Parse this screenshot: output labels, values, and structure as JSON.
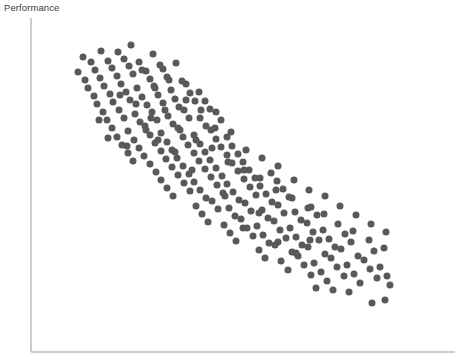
{
  "figure": {
    "width": 455,
    "height": 363,
    "background": "#ffffff"
  },
  "labels": {
    "ylabel": "Performance",
    "xlabel": ""
  },
  "axes": {
    "line_color": "#9a9a9a",
    "line_width": 1,
    "x_axis": {
      "x1": 31,
      "y1": 352,
      "x2": 455,
      "y2": 352
    },
    "y_axis": {
      "x1": 31,
      "y1": 18,
      "x2": 31,
      "y2": 352
    },
    "ticks": "none",
    "tick_labels": "none",
    "grid": false
  },
  "chart_data": {
    "type": "scatter",
    "title": "",
    "xlabel": "",
    "ylabel": "Performance",
    "grid": false,
    "legend": "none",
    "marker": {
      "shape": "circle",
      "color": "#595959",
      "diameter_px": 7,
      "opacity": 1
    },
    "xlim": [
      31,
      455
    ],
    "ylim": [
      18,
      352
    ],
    "y_axis_direction": "inverted-pixel",
    "correlation": "strong negative",
    "n_points": 248,
    "points": [
      [
        83,
        57
      ],
      [
        101,
        51
      ],
      [
        118,
        52
      ],
      [
        131,
        45
      ],
      [
        153,
        54
      ],
      [
        91,
        62
      ],
      [
        108,
        61
      ],
      [
        124,
        59
      ],
      [
        139,
        62
      ],
      [
        160,
        65
      ],
      [
        78,
        72
      ],
      [
        95,
        70
      ],
      [
        112,
        68
      ],
      [
        129,
        66
      ],
      [
        146,
        71
      ],
      [
        163,
        69
      ],
      [
        176,
        63
      ],
      [
        85,
        80
      ],
      [
        100,
        78
      ],
      [
        117,
        76
      ],
      [
        133,
        74
      ],
      [
        150,
        79
      ],
      [
        167,
        77
      ],
      [
        182,
        81
      ],
      [
        88,
        88
      ],
      [
        104,
        86
      ],
      [
        121,
        84
      ],
      [
        137,
        88
      ],
      [
        154,
        86
      ],
      [
        171,
        90
      ],
      [
        186,
        84
      ],
      [
        199,
        92
      ],
      [
        94,
        96
      ],
      [
        110,
        94
      ],
      [
        126,
        92
      ],
      [
        142,
        97
      ],
      [
        158,
        95
      ],
      [
        175,
        99
      ],
      [
        190,
        93
      ],
      [
        205,
        101
      ],
      [
        97,
        104
      ],
      [
        113,
        102
      ],
      [
        130,
        100
      ],
      [
        147,
        105
      ],
      [
        163,
        103
      ],
      [
        179,
        107
      ],
      [
        195,
        101
      ],
      [
        210,
        109
      ],
      [
        103,
        112
      ],
      [
        119,
        110
      ],
      [
        135,
        114
      ],
      [
        152,
        112
      ],
      [
        168,
        116
      ],
      [
        184,
        110
      ],
      [
        200,
        118
      ],
      [
        216,
        112
      ],
      [
        107,
        120
      ],
      [
        124,
        118
      ],
      [
        140,
        122
      ],
      [
        157,
        120
      ],
      [
        173,
        124
      ],
      [
        189,
        118
      ],
      [
        206,
        126
      ],
      [
        221,
        120
      ],
      [
        112,
        128
      ],
      [
        128,
        131
      ],
      [
        145,
        126
      ],
      [
        161,
        133
      ],
      [
        178,
        128
      ],
      [
        194,
        135
      ],
      [
        211,
        130
      ],
      [
        227,
        137
      ],
      [
        117,
        137
      ],
      [
        134,
        140
      ],
      [
        150,
        135
      ],
      [
        167,
        142
      ],
      [
        183,
        137
      ],
      [
        200,
        144
      ],
      [
        216,
        139
      ],
      [
        232,
        146
      ],
      [
        122,
        145
      ],
      [
        139,
        148
      ],
      [
        155,
        143
      ],
      [
        172,
        150
      ],
      [
        188,
        145
      ],
      [
        205,
        152
      ],
      [
        221,
        147
      ],
      [
        238,
        154
      ],
      [
        128,
        153
      ],
      [
        144,
        156
      ],
      [
        161,
        151
      ],
      [
        177,
        158
      ],
      [
        194,
        153
      ],
      [
        210,
        160
      ],
      [
        227,
        155
      ],
      [
        243,
        162
      ],
      [
        133,
        161
      ],
      [
        150,
        164
      ],
      [
        166,
        159
      ],
      [
        183,
        166
      ],
      [
        199,
        161
      ],
      [
        216,
        168
      ],
      [
        232,
        163
      ],
      [
        249,
        170
      ],
      [
        156,
        172
      ],
      [
        172,
        167
      ],
      [
        189,
        174
      ],
      [
        205,
        169
      ],
      [
        222,
        176
      ],
      [
        238,
        171
      ],
      [
        255,
        178
      ],
      [
        271,
        173
      ],
      [
        161,
        180
      ],
      [
        178,
        175
      ],
      [
        194,
        182
      ],
      [
        211,
        177
      ],
      [
        227,
        184
      ],
      [
        244,
        179
      ],
      [
        260,
        186
      ],
      [
        277,
        181
      ],
      [
        167,
        188
      ],
      [
        184,
        183
      ],
      [
        200,
        190
      ],
      [
        217,
        185
      ],
      [
        233,
        192
      ],
      [
        250,
        187
      ],
      [
        266,
        194
      ],
      [
        283,
        189
      ],
      [
        173,
        196
      ],
      [
        190,
        191
      ],
      [
        206,
        198
      ],
      [
        223,
        193
      ],
      [
        239,
        200
      ],
      [
        256,
        195
      ],
      [
        272,
        202
      ],
      [
        289,
        197
      ],
      [
        196,
        206
      ],
      [
        212,
        201
      ],
      [
        229,
        208
      ],
      [
        245,
        203
      ],
      [
        262,
        210
      ],
      [
        278,
        205
      ],
      [
        295,
        212
      ],
      [
        311,
        207
      ],
      [
        202,
        214
      ],
      [
        218,
        209
      ],
      [
        235,
        216
      ],
      [
        251,
        211
      ],
      [
        268,
        218
      ],
      [
        284,
        213
      ],
      [
        301,
        220
      ],
      [
        317,
        215
      ],
      [
        208,
        222
      ],
      [
        224,
        225
      ],
      [
        241,
        219
      ],
      [
        257,
        226
      ],
      [
        274,
        221
      ],
      [
        290,
        228
      ],
      [
        307,
        223
      ],
      [
        323,
        230
      ],
      [
        230,
        233
      ],
      [
        247,
        228
      ],
      [
        263,
        235
      ],
      [
        280,
        230
      ],
      [
        296,
        237
      ],
      [
        313,
        232
      ],
      [
        329,
        239
      ],
      [
        345,
        234
      ],
      [
        236,
        241
      ],
      [
        253,
        236
      ],
      [
        269,
        243
      ],
      [
        286,
        238
      ],
      [
        302,
        245
      ],
      [
        319,
        240
      ],
      [
        335,
        247
      ],
      [
        351,
        242
      ],
      [
        259,
        250
      ],
      [
        275,
        245
      ],
      [
        292,
        252
      ],
      [
        308,
        247
      ],
      [
        325,
        254
      ],
      [
        341,
        249
      ],
      [
        358,
        256
      ],
      [
        374,
        251
      ],
      [
        265,
        258
      ],
      [
        281,
        261
      ],
      [
        298,
        256
      ],
      [
        314,
        263
      ],
      [
        331,
        258
      ],
      [
        347,
        265
      ],
      [
        364,
        260
      ],
      [
        380,
        267
      ],
      [
        288,
        270
      ],
      [
        304,
        265
      ],
      [
        321,
        272
      ],
      [
        337,
        267
      ],
      [
        354,
        274
      ],
      [
        370,
        269
      ],
      [
        387,
        276
      ],
      [
        311,
        275
      ],
      [
        327,
        281
      ],
      [
        344,
        276
      ],
      [
        360,
        283
      ],
      [
        377,
        278
      ],
      [
        390,
        285
      ],
      [
        372,
        303
      ],
      [
        385,
        300
      ],
      [
        316,
        288
      ],
      [
        333,
        290
      ],
      [
        349,
        292
      ],
      [
        142,
        70
      ],
      [
        155,
        88
      ],
      [
        169,
        80
      ],
      [
        186,
        100
      ],
      [
        201,
        110
      ],
      [
        215,
        128
      ],
      [
        231,
        132
      ],
      [
        246,
        150
      ],
      [
        262,
        158
      ],
      [
        278,
        166
      ],
      [
        294,
        180
      ],
      [
        309,
        190
      ],
      [
        325,
        196
      ],
      [
        340,
        206
      ],
      [
        356,
        215
      ],
      [
        371,
        224
      ],
      [
        386,
        232
      ],
      [
        120,
        95
      ],
      [
        136,
        104
      ],
      [
        151,
        118
      ],
      [
        165,
        110
      ],
      [
        180,
        130
      ],
      [
        196,
        140
      ],
      [
        212,
        148
      ],
      [
        228,
        162
      ],
      [
        244,
        170
      ],
      [
        260,
        178
      ],
      [
        276,
        190
      ],
      [
        292,
        198
      ],
      [
        308,
        208
      ],
      [
        324,
        214
      ],
      [
        338,
        224
      ],
      [
        353,
        231
      ],
      [
        369,
        240
      ],
      [
        384,
        248
      ],
      [
        99,
        120
      ],
      [
        108,
        138
      ],
      [
        127,
        146
      ],
      [
        146,
        130
      ],
      [
        243,
        228
      ],
      [
        278,
        242
      ],
      [
        296,
        253
      ],
      [
        310,
        240
      ],
      [
        259,
        213
      ],
      [
        225,
        196
      ],
      [
        192,
        170
      ],
      [
        175,
        152
      ],
      [
        158,
        140
      ]
    ]
  }
}
